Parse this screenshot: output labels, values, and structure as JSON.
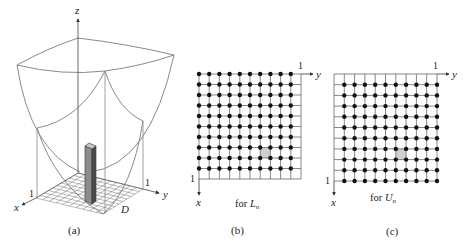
{
  "panels": [
    {
      "id": "a",
      "caption": "(a)",
      "axis_labels": {
        "x": "x",
        "y": "y",
        "z": "z"
      },
      "tick_x": "1",
      "tick_y": "1",
      "region_label": "D",
      "grid_cells": 10
    },
    {
      "id": "b",
      "caption": "(b)",
      "axis_labels": {
        "x": "x",
        "y": "y"
      },
      "tick_x": "1",
      "tick_y": "1",
      "note_prefix": "for ",
      "note_symbol": "L",
      "note_subscript": "n",
      "grid_cells": 10,
      "dot_corner": "top-left",
      "highlight_cell": {
        "row": 7,
        "col": 6
      }
    },
    {
      "id": "c",
      "caption": "(c)",
      "axis_labels": {
        "x": "x",
        "y": "y"
      },
      "tick_x": "1",
      "tick_y": "1",
      "note_prefix": "for ",
      "note_symbol": "U",
      "note_subscript": "n",
      "grid_cells": 10,
      "dot_corner": "bottom-right",
      "highlight_cell": {
        "row": 7,
        "col": 6
      }
    }
  ],
  "colors": {
    "line": "#555555",
    "surface": "#8a8a8a",
    "dot": "#111111",
    "highlight": "#cfcfcf",
    "column_front": "#7a7a7a",
    "column_side": "#4a4a4a",
    "column_top": "#bdbdbd"
  }
}
